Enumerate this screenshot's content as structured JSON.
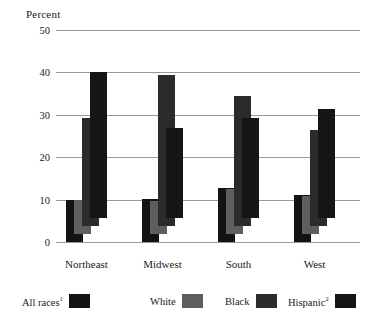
{
  "chart_data": {
    "type": "bar",
    "title": "",
    "subtitle": "",
    "xlabel": "",
    "ylabel": "Percent",
    "ylim": [
      0,
      50
    ],
    "yticks": [
      0,
      10,
      20,
      30,
      40,
      50
    ],
    "grid": true,
    "legend_position": "bottom",
    "categories": [
      "Northeast",
      "Midwest",
      "South",
      "West"
    ],
    "series": [
      {
        "name": "All races",
        "footnote": "1",
        "color": "#131313",
        "values": [
          10.0,
          10.2,
          12.8,
          11.0
        ]
      },
      {
        "name": "White",
        "footnote": "",
        "color": "#5e5e5e",
        "values": [
          8.0,
          7.8,
          10.6,
          9.0
        ]
      },
      {
        "name": "Black",
        "footnote": "",
        "color": "#2b2b2b",
        "values": [
          25.5,
          35.5,
          30.6,
          22.6
        ]
      },
      {
        "name": "Hispanic",
        "footnote": "2",
        "color": "#151515",
        "values": [
          34.5,
          21.2,
          23.7,
          25.6
        ]
      }
    ]
  },
  "legend": {
    "items": [
      {
        "label": "All races",
        "sup": "1"
      },
      {
        "label": "White",
        "sup": ""
      },
      {
        "label": "Black",
        "sup": ""
      },
      {
        "label": "Hispanic",
        "sup": "2"
      }
    ]
  },
  "style": {
    "background": "#ffffff",
    "gridline_color": "#9a9a9a",
    "text_color": "#1a1a1a"
  }
}
